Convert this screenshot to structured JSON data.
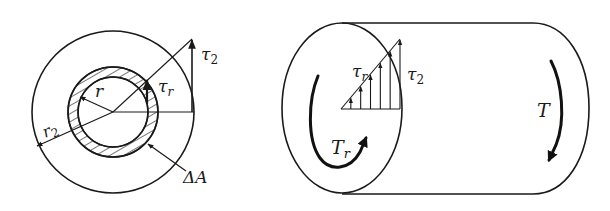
{
  "figure": {
    "left_view": {
      "title": "Cross-section",
      "labels": {
        "tau_2": {
          "base": "τ",
          "sub": "2"
        },
        "tau_r": {
          "base": "τ",
          "sub": "r"
        },
        "r": {
          "base": "r",
          "sub": ""
        },
        "r_2": {
          "base": "r",
          "sub": "2"
        },
        "delta_A": {
          "base": "ΔA",
          "sub": ""
        }
      }
    },
    "right_view": {
      "title": "Shaft segment",
      "labels": {
        "tau_r": {
          "base": "τ",
          "sub": "r"
        },
        "tau_2": {
          "base": "τ",
          "sub": "2"
        },
        "T_r": {
          "base": "T",
          "sub": "r"
        },
        "T": {
          "base": "T",
          "sub": ""
        }
      },
      "stress_arrow_count": 6
    }
  }
}
